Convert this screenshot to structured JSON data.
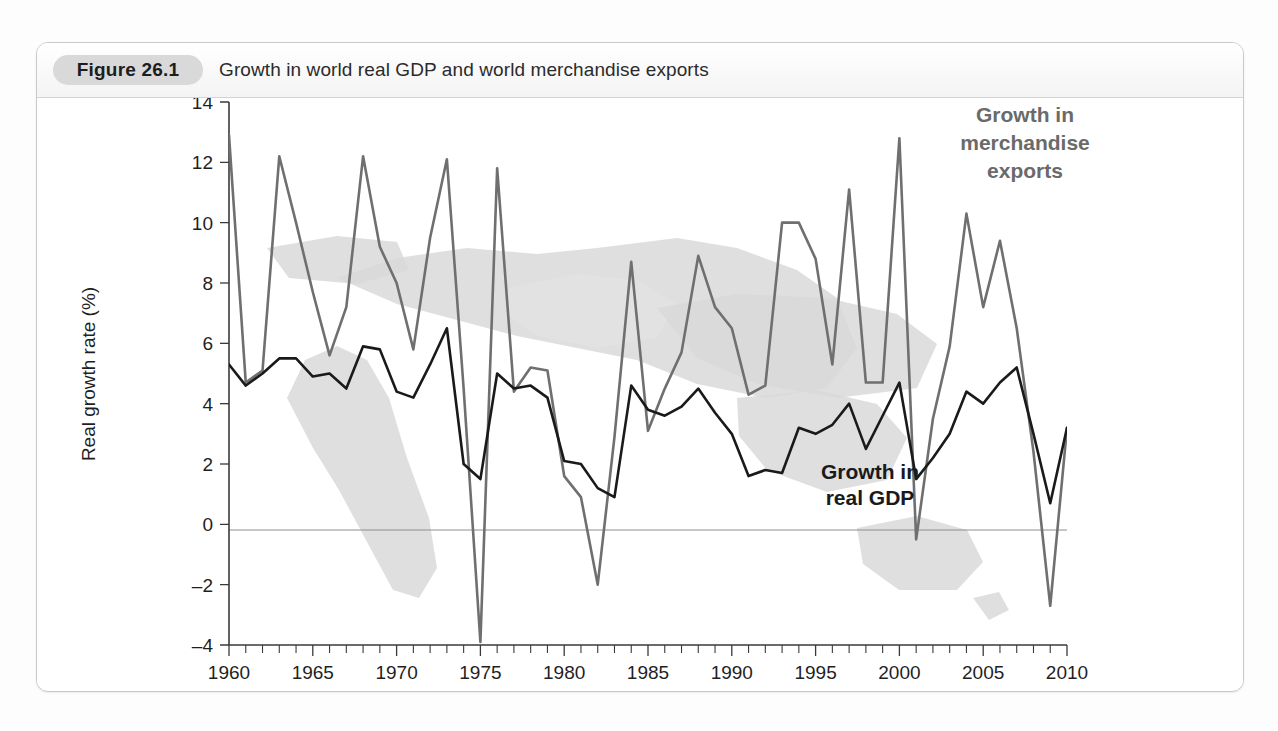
{
  "figure": {
    "badge": "Figure 26.1",
    "caption": "Growth in world real GDP and world merchandise exports"
  },
  "annotations": {
    "exports_label_line1": "Growth in",
    "exports_label_line2": "merchandise",
    "exports_label_line3": "exports",
    "gdp_label_line1": "Growth in",
    "gdp_label_line2": "real GDP"
  },
  "colors": {
    "exports_line": "#6f6f6f",
    "gdp_line": "#1a1a1a",
    "badge_bg": "#d9d9d9",
    "card_border": "#c9c9c9",
    "zero_line": "#8e8e8e",
    "map_fill": "#d9d9d9"
  },
  "chart_data": {
    "type": "line",
    "title": "Growth in world real GDP and world merchandise exports",
    "xlabel": "",
    "ylabel": "Real growth rate (%)",
    "xlim": [
      1960,
      2010
    ],
    "ylim": [
      -4,
      14
    ],
    "ytick_step": 2,
    "yticks": [
      -4,
      -2,
      0,
      2,
      4,
      6,
      8,
      10,
      12,
      14
    ],
    "xticks_labeled": [
      1960,
      1965,
      1970,
      1975,
      1980,
      1985,
      1990,
      1995,
      2000,
      2005,
      2010
    ],
    "xtick_minor_step": 1,
    "grid": false,
    "legend": "inline-annotations",
    "x": [
      1960,
      1961,
      1962,
      1963,
      1964,
      1965,
      1966,
      1967,
      1968,
      1969,
      1970,
      1971,
      1972,
      1973,
      1974,
      1975,
      1976,
      1977,
      1978,
      1979,
      1980,
      1981,
      1982,
      1983,
      1984,
      1985,
      1986,
      1987,
      1988,
      1989,
      1990,
      1991,
      1992,
      1993,
      1994,
      1995,
      1996,
      1997,
      1998,
      1999,
      2000,
      2001,
      2002,
      2003,
      2004,
      2005,
      2006,
      2007,
      2008,
      2009,
      2010
    ],
    "series": [
      {
        "name": "Growth in merchandise exports",
        "color": "#6f6f6f",
        "values": [
          12.9,
          4.7,
          5.1,
          12.2,
          10.0,
          7.7,
          5.6,
          7.2,
          12.2,
          9.2,
          8.0,
          5.8,
          9.5,
          12.1,
          4.5,
          -3.9,
          11.8,
          4.4,
          5.2,
          5.1,
          1.6,
          0.9,
          -2.0,
          2.9,
          8.7,
          3.1,
          4.5,
          5.7,
          8.9,
          7.2,
          6.5,
          4.3,
          4.6,
          10.0,
          10.0,
          8.8,
          5.3,
          11.1,
          4.7,
          4.7,
          12.8,
          -0.5,
          3.5,
          5.9,
          10.3,
          7.2,
          9.4,
          6.5,
          2.4,
          -2.7,
          3.2
        ]
      },
      {
        "name": "Growth in real GDP",
        "color": "#1a1a1a",
        "values": [
          5.3,
          4.6,
          5.0,
          5.5,
          5.5,
          4.9,
          5.0,
          4.5,
          5.9,
          5.8,
          4.4,
          4.2,
          5.3,
          6.5,
          2.0,
          1.5,
          5.0,
          4.5,
          4.6,
          4.2,
          2.1,
          2.0,
          1.2,
          0.9,
          4.6,
          3.8,
          3.6,
          3.9,
          4.5,
          3.7,
          3.0,
          1.6,
          1.8,
          1.7,
          3.2,
          3.0,
          3.3,
          4.0,
          2.5,
          3.6,
          4.7,
          1.5,
          2.2,
          3.0,
          4.4,
          4.0,
          4.7,
          5.2,
          3.0,
          0.7,
          3.2
        ]
      }
    ]
  }
}
